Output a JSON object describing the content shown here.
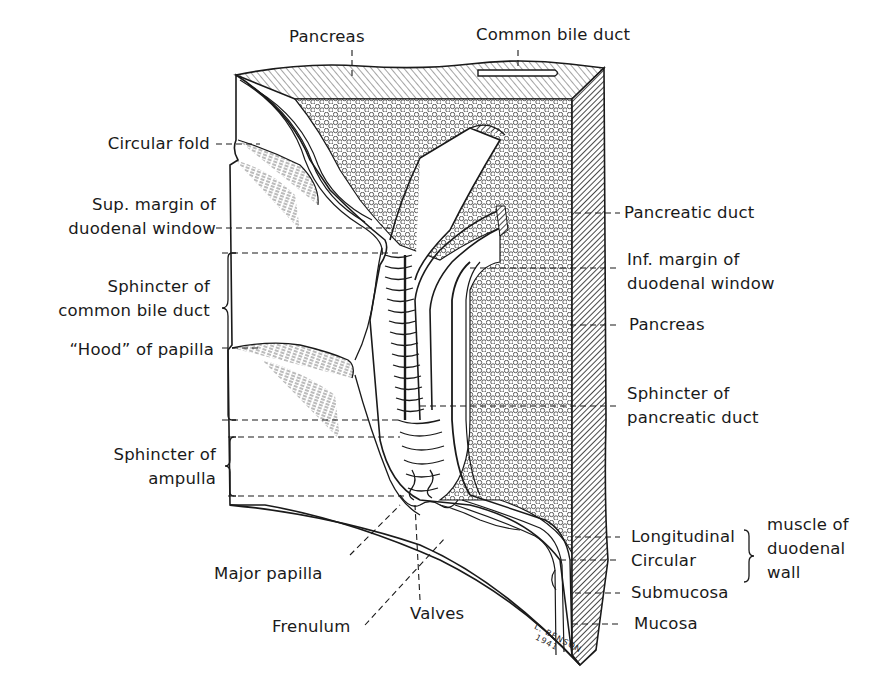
{
  "figure": {
    "colors": {
      "ink": "#1a1a1a",
      "paper": "#ffffff"
    },
    "signature": {
      "line1": "L. BENSON",
      "line2": "1941"
    }
  },
  "labels": {
    "top": [
      {
        "id": "pancreas-top",
        "text": "Pancreas"
      },
      {
        "id": "common-bile-duct-top",
        "text": "Common bile duct"
      }
    ],
    "left": [
      {
        "id": "circular-fold",
        "lines": [
          "Circular fold"
        ]
      },
      {
        "id": "sup-margin",
        "lines": [
          "Sup. margin of",
          "duodenal window"
        ]
      },
      {
        "id": "sphincter-cbd",
        "lines": [
          "Sphincter of",
          "common bile duct"
        ]
      },
      {
        "id": "hood-of-papilla",
        "lines": [
          "“Hood” of papilla"
        ]
      },
      {
        "id": "sphincter-ampulla",
        "lines": [
          "Sphincter of",
          "ampulla"
        ]
      }
    ],
    "right": [
      {
        "id": "pancreatic-duct",
        "lines": [
          "Pancreatic duct"
        ]
      },
      {
        "id": "inf-margin",
        "lines": [
          "Inf. margin of",
          "duodenal window"
        ]
      },
      {
        "id": "pancreas-right",
        "lines": [
          "Pancreas"
        ]
      },
      {
        "id": "sphincter-pancreatic-duct",
        "lines": [
          "Sphincter of",
          "pancreatic duct"
        ]
      },
      {
        "id": "longitudinal",
        "lines": [
          "Longitudinal"
        ]
      },
      {
        "id": "circular",
        "lines": [
          "Circular"
        ]
      },
      {
        "id": "muscle-group",
        "lines": [
          "muscle of",
          "duodenal",
          "wall"
        ]
      },
      {
        "id": "submucosa",
        "lines": [
          "Submucosa"
        ]
      },
      {
        "id": "mucosa",
        "lines": [
          "Mucosa"
        ]
      }
    ],
    "bottom": [
      {
        "id": "major-papilla",
        "text": "Major papilla"
      },
      {
        "id": "frenulum",
        "text": "Frenulum"
      },
      {
        "id": "valves",
        "text": "Valves"
      }
    ]
  }
}
